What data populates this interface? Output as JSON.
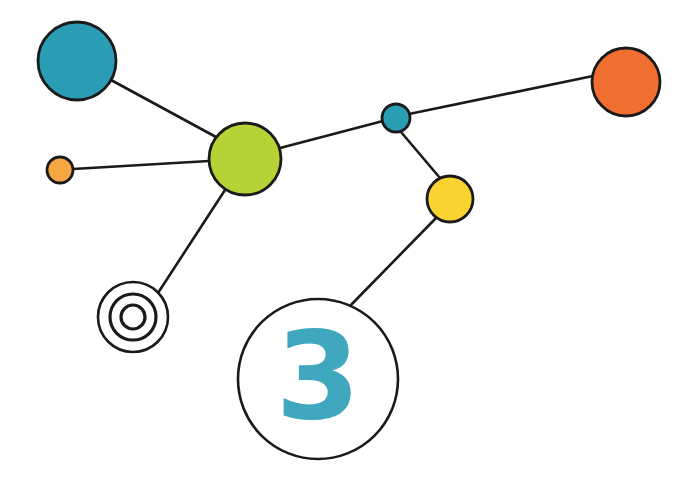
{
  "canvas": {
    "width": 692,
    "height": 486,
    "background": "#ffffff",
    "title": "Network node diagram"
  },
  "style": {
    "stroke_color": "#1a1a1a",
    "edge_width": 2.6,
    "node_stroke_width": 2.8
  },
  "nodes": [
    {
      "id": "teal-large",
      "label": "teal-large-node",
      "cx": 77,
      "cy": 61,
      "r": 39,
      "fill": "#2a9db5",
      "kind": "filled"
    },
    {
      "id": "orange-small",
      "label": "orange-small-node",
      "cx": 60,
      "cy": 170,
      "r": 13,
      "fill": "#f5a742",
      "kind": "filled"
    },
    {
      "id": "green-large",
      "label": "green-large-node",
      "cx": 245,
      "cy": 159,
      "r": 36,
      "fill": "#b5d334",
      "kind": "filled"
    },
    {
      "id": "teal-small",
      "label": "teal-small-node",
      "cx": 396,
      "cy": 118,
      "r": 14,
      "fill": "#2a9db5",
      "kind": "filled"
    },
    {
      "id": "orange-large",
      "label": "orange-large-node",
      "cx": 626,
      "cy": 82,
      "r": 34,
      "fill": "#f06f30",
      "kind": "filled"
    },
    {
      "id": "yellow-medium",
      "label": "yellow-medium-node",
      "cx": 450,
      "cy": 199,
      "r": 23,
      "fill": "#f9d330",
      "kind": "filled"
    },
    {
      "id": "bullseye",
      "label": "bullseye-target-node",
      "cx": 133,
      "cy": 317,
      "r": 35,
      "fill": "#ffffff",
      "kind": "concentric",
      "rings": [
        35,
        23,
        12
      ]
    },
    {
      "id": "numbered",
      "label": "numbered-node",
      "cx": 318,
      "cy": 379,
      "r": 80,
      "fill": "#ffffff",
      "kind": "numbered",
      "number": "3",
      "number_color": "#3fa7be"
    }
  ],
  "edges": [
    {
      "id": "edge-teal-green",
      "from": "teal-large",
      "to": "green-large",
      "x1": 111,
      "y1": 80,
      "x2": 216,
      "y2": 137
    },
    {
      "id": "edge-orange-green",
      "from": "orange-small",
      "to": "green-large",
      "x1": 73,
      "y1": 169,
      "x2": 209,
      "y2": 161
    },
    {
      "id": "edge-green-tealsmall",
      "from": "green-large",
      "to": "teal-small",
      "x1": 280,
      "y1": 148,
      "x2": 383,
      "y2": 121
    },
    {
      "id": "edge-tealsmall-orange",
      "from": "teal-small",
      "to": "orange-large",
      "x1": 409,
      "y1": 114,
      "x2": 593,
      "y2": 76
    },
    {
      "id": "edge-tealsmall-yellow",
      "from": "teal-small",
      "to": "yellow-medium",
      "x1": 401,
      "y1": 132,
      "x2": 440,
      "y2": 178
    },
    {
      "id": "edge-green-bullseye",
      "from": "green-large",
      "to": "bullseye",
      "x1": 225,
      "y1": 190,
      "x2": 158,
      "y2": 293
    },
    {
      "id": "edge-yellow-numbered",
      "from": "yellow-medium",
      "to": "numbered",
      "x1": 437,
      "y1": 217,
      "x2": 348,
      "y2": 308
    }
  ],
  "chart_data": {
    "type": "scatter",
    "xlabel": "",
    "ylabel": "",
    "xlim": [
      0,
      692
    ],
    "ylim": [
      0,
      486
    ],
    "grid": false,
    "legend": "none",
    "series": [
      {
        "name": "nodes",
        "points": [
          {
            "label": "teal-large",
            "x": 77,
            "y": 61,
            "size": 39,
            "color": "#2a9db5"
          },
          {
            "label": "orange-small",
            "x": 60,
            "y": 170,
            "size": 13,
            "color": "#f5a742"
          },
          {
            "label": "green-large",
            "x": 245,
            "y": 159,
            "size": 36,
            "color": "#b5d334"
          },
          {
            "label": "teal-small",
            "x": 396,
            "y": 118,
            "size": 14,
            "color": "#2a9db5"
          },
          {
            "label": "orange-large",
            "x": 626,
            "y": 82,
            "size": 34,
            "color": "#f06f30"
          },
          {
            "label": "yellow-medium",
            "x": 450,
            "y": 199,
            "size": 23,
            "color": "#f9d330"
          },
          {
            "label": "bullseye",
            "x": 133,
            "y": 317,
            "size": 35,
            "color": "#ffffff"
          },
          {
            "label": "numbered-3",
            "x": 318,
            "y": 379,
            "size": 80,
            "color": "#ffffff"
          }
        ]
      }
    ],
    "links": [
      [
        "teal-large",
        "green-large"
      ],
      [
        "orange-small",
        "green-large"
      ],
      [
        "green-large",
        "teal-small"
      ],
      [
        "teal-small",
        "orange-large"
      ],
      [
        "teal-small",
        "yellow-medium"
      ],
      [
        "green-large",
        "bullseye"
      ],
      [
        "yellow-medium",
        "numbered-3"
      ]
    ],
    "annotations": [
      {
        "text": "3",
        "x": 318,
        "y": 379,
        "color": "#3fa7be"
      }
    ]
  }
}
